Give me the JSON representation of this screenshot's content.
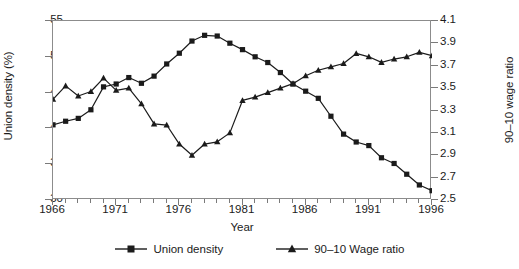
{
  "chart_data": {
    "type": "line",
    "title": "",
    "xlabel": "Year",
    "ylabel": "Union density (%)",
    "ylabel_right": "90–10 wage ratio",
    "grid": false,
    "legend_position": "bottom",
    "x": [
      1966,
      1967,
      1968,
      1969,
      1970,
      1971,
      1972,
      1973,
      1974,
      1975,
      1976,
      1977,
      1978,
      1979,
      1980,
      1981,
      1982,
      1983,
      1984,
      1985,
      1986,
      1987,
      1988,
      1989,
      1990,
      1991,
      1992,
      1993,
      1994,
      1995,
      1996
    ],
    "xlim": [
      1966,
      1996
    ],
    "xticks_major": [
      1966,
      1971,
      1976,
      1981,
      1986,
      1991,
      1996
    ],
    "xtick_labels": [
      "1966",
      "1971",
      "1976",
      "1981",
      "1986",
      "1991",
      "1996"
    ],
    "ylim": [
      30,
      55
    ],
    "yticks": [
      30,
      35,
      40,
      45,
      50,
      55
    ],
    "ytick_labels": [
      "30",
      "35",
      "40",
      "45",
      "50",
      "55"
    ],
    "ylim_right": [
      2.5,
      4.1
    ],
    "yticks_right": [
      2.5,
      2.7,
      2.9,
      3.1,
      3.3,
      3.5,
      3.7,
      3.9,
      4.1
    ],
    "ytick_labels_right": [
      "2.5",
      "2.7",
      "2.9",
      "3.1",
      "3.3",
      "3.5",
      "3.7",
      "3.9",
      "4.1"
    ],
    "series": [
      {
        "name": "Union density",
        "axis": "left",
        "marker": "square",
        "color": "#1b1b1b",
        "values": [
          40.5,
          41.0,
          41.4,
          42.6,
          45.8,
          46.2,
          47.1,
          46.3,
          47.3,
          49.0,
          50.5,
          52.2,
          53.0,
          52.9,
          51.9,
          51.0,
          50.0,
          49.2,
          47.8,
          46.2,
          45.2,
          44.2,
          41.7,
          39.2,
          38.1,
          37.6,
          35.9,
          35.1,
          33.6,
          32.1,
          31.3
        ]
      },
      {
        "name": "90–10 Wage ratio",
        "axis": "right",
        "marker": "triangle",
        "color": "#1b1b1b",
        "values": [
          3.4,
          3.52,
          3.43,
          3.47,
          3.59,
          3.48,
          3.5,
          3.36,
          3.18,
          3.17,
          3.0,
          2.9,
          3.0,
          3.02,
          3.1,
          3.39,
          3.42,
          3.46,
          3.5,
          3.54,
          3.61,
          3.66,
          3.69,
          3.72,
          3.81,
          3.78,
          3.73,
          3.76,
          3.78,
          3.82,
          3.79
        ]
      }
    ]
  },
  "legend": {
    "entries": [
      {
        "label": "Union density",
        "marker": "square"
      },
      {
        "label": "90–10 Wage ratio",
        "marker": "triangle"
      }
    ]
  }
}
